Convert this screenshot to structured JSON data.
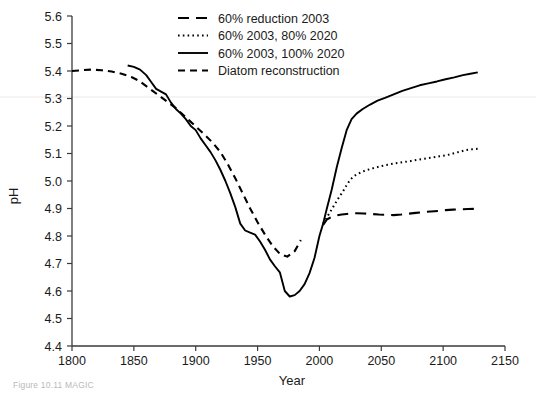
{
  "figure": {
    "caption": "Figure 10.11   MAGIC"
  },
  "chart_data": {
    "type": "line",
    "title": "",
    "xlabel": "Year",
    "ylabel": "pH",
    "xlim": [
      1800,
      2150
    ],
    "ylim": [
      4.4,
      5.6
    ],
    "xticks": [
      1800,
      1850,
      1900,
      1950,
      2000,
      2050,
      2100,
      2150
    ],
    "yticks": [
      4.4,
      4.5,
      4.6,
      4.7,
      4.8,
      4.9,
      5.0,
      5.1,
      5.2,
      5.3,
      5.4,
      5.5,
      5.6
    ],
    "xtick_labels": [
      "1800",
      "1850",
      "1900",
      "1950",
      "2000",
      "2050",
      "2100",
      "2150"
    ],
    "ytick_labels": [
      "4.4",
      "4.5",
      "4.6",
      "4.7",
      "4.8",
      "4.9",
      "5.0",
      "5.1",
      "5.2",
      "5.3",
      "5.4",
      "5.5",
      "5.6"
    ],
    "grid": false,
    "legend_position": "top-center",
    "series": [
      {
        "name": "60% reduction 2003",
        "style": "dashed",
        "x": [
          2003,
          2006,
          2010,
          2014,
          2018,
          2022,
          2026,
          2030,
          2036,
          2042,
          2048,
          2054,
          2060,
          2066,
          2072,
          2078,
          2084,
          2090,
          2096,
          2102,
          2108,
          2114,
          2120,
          2128
        ],
        "values": [
          4.84,
          4.86,
          4.87,
          4.875,
          4.878,
          4.88,
          4.882,
          4.883,
          4.882,
          4.88,
          4.878,
          4.877,
          4.876,
          4.878,
          4.881,
          4.884,
          4.887,
          4.889,
          4.891,
          4.894,
          4.896,
          4.897,
          4.898,
          4.899
        ]
      },
      {
        "name": "60% 2003, 80% 2020",
        "style": "dotted",
        "x": [
          2003,
          2007,
          2011,
          2015,
          2019,
          2022,
          2025,
          2028,
          2032,
          2037,
          2043,
          2049,
          2055,
          2061,
          2067,
          2073,
          2079,
          2085,
          2091,
          2097,
          2103,
          2108,
          2113,
          2118,
          2123,
          2128
        ],
        "values": [
          4.845,
          4.875,
          4.905,
          4.935,
          4.962,
          4.985,
          5.005,
          5.018,
          5.028,
          5.038,
          5.046,
          5.053,
          5.059,
          5.064,
          5.068,
          5.072,
          5.077,
          5.081,
          5.085,
          5.09,
          5.094,
          5.1,
          5.106,
          5.112,
          5.115,
          5.117
        ]
      },
      {
        "name": "60% 2003, 100% 2020",
        "style": "solid",
        "x": [
          1845,
          1850,
          1855,
          1860,
          1864,
          1868,
          1872,
          1876,
          1880,
          1884,
          1888,
          1892,
          1896,
          1900,
          1904,
          1908,
          1912,
          1916,
          1920,
          1924,
          1928,
          1932,
          1936,
          1940,
          1944,
          1948,
          1952,
          1956,
          1960,
          1964,
          1968,
          1972,
          1976,
          1980,
          1984,
          1988,
          1992,
          1996,
          2000,
          2003,
          2006,
          2010,
          2014,
          2018,
          2022,
          2026,
          2030,
          2035,
          2041,
          2047,
          2053,
          2060,
          2067,
          2074,
          2081,
          2088,
          2095,
          2102,
          2109,
          2116,
          2122,
          2128
        ],
        "values": [
          5.42,
          5.415,
          5.405,
          5.385,
          5.36,
          5.335,
          5.325,
          5.315,
          5.285,
          5.262,
          5.245,
          5.225,
          5.2,
          5.185,
          5.155,
          5.13,
          5.105,
          5.075,
          5.04,
          5.0,
          4.955,
          4.905,
          4.845,
          4.82,
          4.812,
          4.805,
          4.78,
          4.75,
          4.715,
          4.69,
          4.668,
          4.6,
          4.58,
          4.585,
          4.6,
          4.625,
          4.665,
          4.72,
          4.8,
          4.845,
          4.9,
          4.97,
          5.05,
          5.12,
          5.185,
          5.225,
          5.245,
          5.262,
          5.278,
          5.292,
          5.302,
          5.315,
          5.328,
          5.338,
          5.348,
          5.355,
          5.362,
          5.37,
          5.377,
          5.385,
          5.39,
          5.395
        ]
      },
      {
        "name": "Diatom reconstruction",
        "style": "dashed-short",
        "x": [
          1800,
          1808,
          1816,
          1824,
          1832,
          1840,
          1848,
          1854,
          1860,
          1866,
          1872,
          1878,
          1884,
          1890,
          1896,
          1902,
          1908,
          1914,
          1920,
          1926,
          1932,
          1938,
          1944,
          1950,
          1956,
          1962,
          1968,
          1974,
          1980,
          1985
        ],
        "values": [
          5.4,
          5.403,
          5.405,
          5.403,
          5.398,
          5.39,
          5.378,
          5.365,
          5.345,
          5.325,
          5.305,
          5.285,
          5.265,
          5.24,
          5.215,
          5.19,
          5.165,
          5.138,
          5.105,
          5.06,
          5.01,
          4.955,
          4.9,
          4.85,
          4.805,
          4.765,
          4.735,
          4.725,
          4.745,
          4.785
        ]
      }
    ]
  },
  "legend": {
    "items": [
      {
        "label": "60% reduction 2003"
      },
      {
        "label": "60% 2003, 80% 2020"
      },
      {
        "label": "60% 2003, 100% 2020"
      },
      {
        "label": "Diatom reconstruction"
      }
    ]
  }
}
